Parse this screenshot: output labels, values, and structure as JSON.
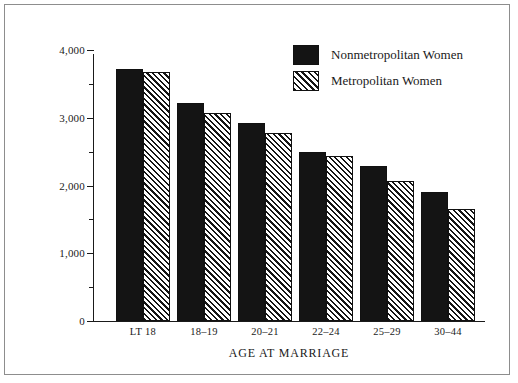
{
  "chart_data": {
    "type": "bar",
    "title": "",
    "xlabel": "AGE AT MARRIAGE",
    "ylabel": "CHILDREN EVER BORN PER 1,000 WOMEN",
    "categories": [
      "LT 18",
      "18–19",
      "20–21",
      "22–24",
      "25–29",
      "30–44"
    ],
    "series": [
      {
        "name": "Nonmetropolitan Women",
        "fill": "solid",
        "color": "#141414",
        "values": [
          3715,
          3220,
          2920,
          2490,
          2290,
          1900
        ]
      },
      {
        "name": "Metropolitan Women",
        "fill": "hatch",
        "color": "#151515",
        "values": [
          3670,
          3070,
          2770,
          2430,
          2070,
          1660
        ]
      }
    ],
    "ylim": [
      0,
      4000
    ],
    "y_major_ticks": [
      0,
      1000,
      2000,
      3000,
      4000
    ],
    "y_major_tick_labels": [
      "0",
      "1,000",
      "2,000",
      "3,000",
      "4,000"
    ],
    "y_minor_ticks": [
      500,
      1500,
      2500,
      3500
    ],
    "grid": false,
    "legend_position": "top-right"
  },
  "legend": {
    "entries": [
      {
        "label": "Nonmetropolitan Women",
        "swatch": "solid-swatch"
      },
      {
        "label": "Metropolitan Women",
        "swatch": "hatch-swatch"
      }
    ]
  }
}
